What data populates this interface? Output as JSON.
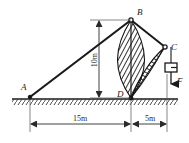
{
  "diagram": {
    "background_color": "#ffffff",
    "line_color": "#1a1a1a",
    "hatch_color": "#111111",
    "ground_color": "#333333",
    "nodes": [
      {
        "id": "A",
        "label": "A",
        "x": 30,
        "y": 97,
        "label_x": 21,
        "label_y": 90
      },
      {
        "id": "B",
        "label": "B",
        "x": 131,
        "y": 19,
        "label_x": 137,
        "label_y": 15
      },
      {
        "id": "C",
        "label": "C",
        "x": 165,
        "y": 47,
        "label_x": 171,
        "label_y": 49
      },
      {
        "id": "D",
        "label": "D",
        "x": 131,
        "y": 98,
        "label_x": 118,
        "label_y": 97
      }
    ],
    "members": [
      {
        "name": "member-AB",
        "from": "A",
        "to": "B"
      },
      {
        "name": "member-BC",
        "from": "B",
        "to": "C"
      },
      {
        "name": "member-BD",
        "from": "B",
        "to": "D"
      },
      {
        "name": "member-DC",
        "from": "D",
        "to": "C"
      }
    ],
    "dimensions": {
      "height": {
        "label": "10m",
        "value": 10,
        "unit": "m",
        "orientation": "vertical"
      },
      "span_left": {
        "label": "15m",
        "value": 15,
        "unit": "m",
        "orientation": "horizontal"
      },
      "span_right": {
        "label": "5m",
        "value": 5,
        "unit": "m",
        "orientation": "horizontal"
      }
    },
    "load": {
      "force_label": "F",
      "direction": "downward",
      "symbol": "weight-block"
    },
    "hatching": {
      "bd_region": "lens-shaped diagonal hatch between B and D",
      "dc_region": "wedge-shaped diagonal hatch between D and C"
    },
    "ground": {
      "type": "fixed-support-hatch",
      "y": 99,
      "x_start": 12,
      "x_end": 178
    }
  }
}
